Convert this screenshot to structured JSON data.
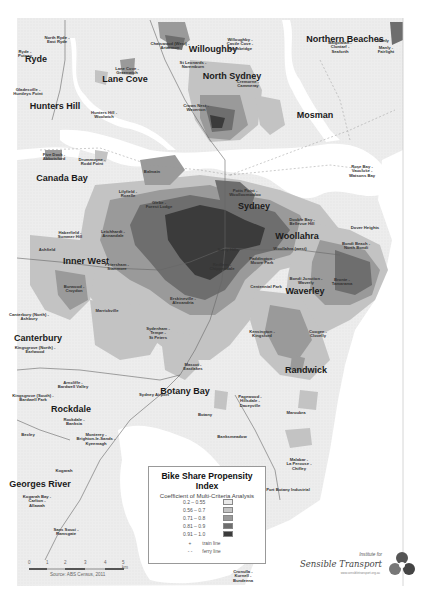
{
  "map": {
    "title": "Bike Share Propensity Index",
    "subtitle": "Coefficient of Multi-Criteria Analysis",
    "legend": {
      "classes": [
        {
          "range": "0.2 – 0.55",
          "color": "#e9e9e9"
        },
        {
          "range": "0.56 – 0.7",
          "color": "#c3c3c3"
        },
        {
          "range": "0.71 – 0.8",
          "color": "#9a9a9a"
        },
        {
          "range": "0.81 – 0.9",
          "color": "#6e6e6e"
        },
        {
          "range": "0.91 – 1.0",
          "color": "#3b3b3b"
        }
      ],
      "lines": [
        {
          "label": "train line",
          "symbol": "+"
        },
        {
          "label": "ferry line",
          "symbol": "- -"
        }
      ]
    },
    "scale_bar": {
      "ticks": [
        "0",
        "1",
        "2",
        "3",
        "4",
        "5 km"
      ]
    },
    "source": "Source: ABS Census, 2011",
    "credit": {
      "pre": "Institute for",
      "name": "Sensible Transport",
      "url": "www.sensibletransport.org.au"
    },
    "regions": [
      {
        "name": "Ryde",
        "x": 36,
        "y": 60,
        "big": true
      },
      {
        "name": "Hunters Hill",
        "x": 55,
        "y": 107,
        "big": true
      },
      {
        "name": "Lane Cove",
        "x": 125,
        "y": 80,
        "big": true
      },
      {
        "name": "Willoughby",
        "x": 213,
        "y": 50,
        "big": true
      },
      {
        "name": "North Sydney",
        "x": 232,
        "y": 77,
        "big": true
      },
      {
        "name": "Northern Beaches",
        "x": 345,
        "y": 40,
        "big": true
      },
      {
        "name": "Mosman",
        "x": 315,
        "y": 116,
        "big": true
      },
      {
        "name": "Canada Bay",
        "x": 62,
        "y": 179,
        "big": true
      },
      {
        "name": "Sydney",
        "x": 254,
        "y": 207,
        "big": true
      },
      {
        "name": "Woollahra",
        "x": 297,
        "y": 237,
        "big": true
      },
      {
        "name": "Inner West",
        "x": 86,
        "y": 262,
        "big": true
      },
      {
        "name": "Waverley",
        "x": 305,
        "y": 292,
        "big": true
      },
      {
        "name": "Canterbury",
        "x": 38,
        "y": 339,
        "big": true
      },
      {
        "name": "Randwick",
        "x": 306,
        "y": 371,
        "big": true
      },
      {
        "name": "Rockdale",
        "x": 71,
        "y": 410,
        "big": true
      },
      {
        "name": "Botany Bay",
        "x": 185,
        "y": 392,
        "big": true
      },
      {
        "name": "Georges River",
        "x": 40,
        "y": 485,
        "big": true
      },
      {
        "name": "North Ryde - East Ryde",
        "x": 57,
        "y": 40,
        "big": false
      },
      {
        "name": "Ryde - Putney",
        "x": 25,
        "y": 54,
        "big": false
      },
      {
        "name": "Gladesville - Huntleys Point",
        "x": 28,
        "y": 92,
        "big": false
      },
      {
        "name": "Hunters Hill - Woolwich",
        "x": 104,
        "y": 115,
        "big": false
      },
      {
        "name": "Lane Cove - Greenwich",
        "x": 127,
        "y": 71,
        "big": false
      },
      {
        "name": "Chatswood (West) - Artarmon",
        "x": 170,
        "y": 46,
        "big": false
      },
      {
        "name": "Willoughby - Castle Cove - Northbridge",
        "x": 240,
        "y": 45,
        "big": false
      },
      {
        "name": "St Leonards - Naremburn",
        "x": 193,
        "y": 65,
        "big": false
      },
      {
        "name": "Cremorne - Cammeray",
        "x": 248,
        "y": 84,
        "big": false
      },
      {
        "name": "Crows Nest - Waverton",
        "x": 196,
        "y": 108,
        "big": false
      },
      {
        "name": "Balgowlah - Clontarf - Seaforth",
        "x": 340,
        "y": 48,
        "big": false
      },
      {
        "name": "Manly",
        "x": 383,
        "y": 41,
        "big": false
      },
      {
        "name": "Manly - Fairlight",
        "x": 386,
        "y": 50,
        "big": false
      },
      {
        "name": "Five Dock - Abbotsford",
        "x": 54,
        "y": 157,
        "big": false
      },
      {
        "name": "Drummoyne - Rodd Point",
        "x": 92,
        "y": 162,
        "big": false
      },
      {
        "name": "Rose Bay - Vaucluse - Watsons Bay",
        "x": 362,
        "y": 172,
        "big": false
      },
      {
        "name": "Lilyfield - Rozelle",
        "x": 128,
        "y": 194,
        "big": false
      },
      {
        "name": "Balmain",
        "x": 152,
        "y": 172,
        "big": false
      },
      {
        "name": "Glebe - Forest Lodge",
        "x": 159,
        "y": 205,
        "big": false
      },
      {
        "name": "Potts Point - Woolloomooloo",
        "x": 245,
        "y": 193,
        "big": false
      },
      {
        "name": "Double Bay - Bellevue Hill",
        "x": 302,
        "y": 222,
        "big": false
      },
      {
        "name": "Dover Heights",
        "x": 365,
        "y": 228,
        "big": false
      },
      {
        "name": "Haberfield - Summer Hill",
        "x": 70,
        "y": 235,
        "big": false
      },
      {
        "name": "Leichhardt - Annandale",
        "x": 113,
        "y": 234,
        "big": false
      },
      {
        "name": "Ashfield",
        "x": 47,
        "y": 250,
        "big": false
      },
      {
        "name": "Paddington - Moore Park",
        "x": 262,
        "y": 261,
        "big": false
      },
      {
        "name": "Surry Hills",
        "x": 228,
        "y": 250,
        "big": false
      },
      {
        "name": "Redfern - Chippendale",
        "x": 222,
        "y": 267,
        "big": false
      },
      {
        "name": "Woollahra (west)",
        "x": 290,
        "y": 249,
        "big": false
      },
      {
        "name": "Bondi Beach - North Bondi",
        "x": 356,
        "y": 246,
        "big": false
      },
      {
        "name": "Centennial Park",
        "x": 266,
        "y": 287,
        "big": false
      },
      {
        "name": "Bondi Junction - Waverly",
        "x": 306,
        "y": 281,
        "big": false
      },
      {
        "name": "Bronte - Tamarama",
        "x": 342,
        "y": 282,
        "big": false
      },
      {
        "name": "Petersham - Stanmore",
        "x": 117,
        "y": 267,
        "big": false
      },
      {
        "name": "Burwood - Croydon",
        "x": 74,
        "y": 289,
        "big": false
      },
      {
        "name": "Marrickville",
        "x": 107,
        "y": 311,
        "big": false
      },
      {
        "name": "Sydenham - Tempe - St Peters",
        "x": 158,
        "y": 334,
        "big": false
      },
      {
        "name": "Erskineville - Alexandria",
        "x": 183,
        "y": 301,
        "big": false
      },
      {
        "name": "Kensington - Kingsford",
        "x": 262,
        "y": 334,
        "big": false
      },
      {
        "name": "Coogee - Clovelly",
        "x": 318,
        "y": 334,
        "big": false
      },
      {
        "name": "Canterbury (North) - Ashbury",
        "x": 29,
        "y": 317,
        "big": false
      },
      {
        "name": "Kingsgrove (North) - Earlwood",
        "x": 35,
        "y": 350,
        "big": false
      },
      {
        "name": "Mascot - Eastlakes",
        "x": 193,
        "y": 367,
        "big": false
      },
      {
        "name": "Sydney Airport",
        "x": 154,
        "y": 395,
        "big": false
      },
      {
        "name": "Pagewood - Hillsdale - Daceyville",
        "x": 250,
        "y": 402,
        "big": false
      },
      {
        "name": "Maroubra",
        "x": 296,
        "y": 413,
        "big": false
      },
      {
        "name": "Arncliffe - Bardwell Valley",
        "x": 73,
        "y": 385,
        "big": false
      },
      {
        "name": "Kingsgrove (South) - Bardwell Park",
        "x": 33,
        "y": 398,
        "big": false
      },
      {
        "name": "Botany",
        "x": 205,
        "y": 415,
        "big": false
      },
      {
        "name": "Banksmeadow",
        "x": 232,
        "y": 437,
        "big": false
      },
      {
        "name": "Bexley",
        "x": 28,
        "y": 435,
        "big": false
      },
      {
        "name": "Rockdale - Banksia",
        "x": 74,
        "y": 422,
        "big": false
      },
      {
        "name": "Monterey - Brighton-le-Sands - Kyeemagh",
        "x": 96,
        "y": 440,
        "big": false
      },
      {
        "name": "Malabar - La Perouse - Chifley",
        "x": 299,
        "y": 465,
        "big": false
      },
      {
        "name": "Kogarah",
        "x": 64,
        "y": 471,
        "big": false
      },
      {
        "name": "Port Botany Industrial",
        "x": 288,
        "y": 490,
        "big": false
      },
      {
        "name": "Kogarah Bay - Carlton - Allawah",
        "x": 37,
        "y": 502,
        "big": false
      },
      {
        "name": "Sans Souci - Ramsgate",
        "x": 66,
        "y": 532,
        "big": false
      },
      {
        "name": "Cronulla - Kurnell - Bundeena",
        "x": 243,
        "y": 577,
        "big": false
      }
    ]
  }
}
